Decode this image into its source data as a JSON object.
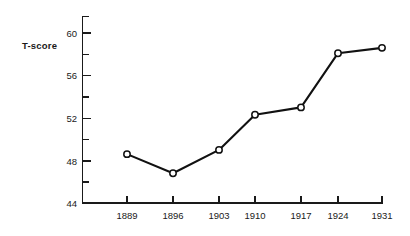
{
  "chart_data": {
    "type": "line",
    "title": "",
    "subtitle": "",
    "xlabel": "",
    "ylabel": "T-score",
    "categories": [
      "1889",
      "1896",
      "1903",
      "1910",
      "1917",
      "1924",
      "1931"
    ],
    "x": [
      1889,
      1896,
      1903,
      1910,
      1917,
      1924,
      1931
    ],
    "values": [
      48.6,
      46.8,
      49.0,
      52.3,
      53.0,
      58.1,
      58.6
    ],
    "series": [
      {
        "name": "T-score",
        "values": [
          48.6,
          46.8,
          49.0,
          52.3,
          53.0,
          58.1,
          58.6
        ]
      }
    ],
    "ylim": [
      44,
      61.6
    ],
    "xlim": [
      1885.5,
      1931
    ],
    "y_ticks_major": [
      44,
      48,
      52,
      56,
      60
    ],
    "y_tick_labels": [
      "44",
      "48",
      "52",
      "56",
      "60"
    ],
    "y_ticks_minor": [
      46,
      50,
      54,
      58
    ],
    "x_tick_labels": [
      "1889",
      "1896",
      "1903",
      "1910",
      "1917",
      "1924",
      "1931"
    ],
    "grid": false,
    "legend": "none",
    "marker": "open-circle",
    "line_color": "#111111",
    "marker_fill": "#ffffff",
    "marker_stroke": "#111111",
    "axis_color": "#1a1a1a",
    "background": "#ffffff"
  },
  "axis": {
    "y_title": "T-score",
    "y_labels": {
      "t44": "44",
      "t48": "48",
      "t52": "52",
      "t56": "56",
      "t60": "60"
    },
    "x_labels": {
      "c0": "1889",
      "c1": "1896",
      "c2": "1903",
      "c3": "1910",
      "c4": "1917",
      "c5": "1924",
      "c6": "1931"
    }
  }
}
